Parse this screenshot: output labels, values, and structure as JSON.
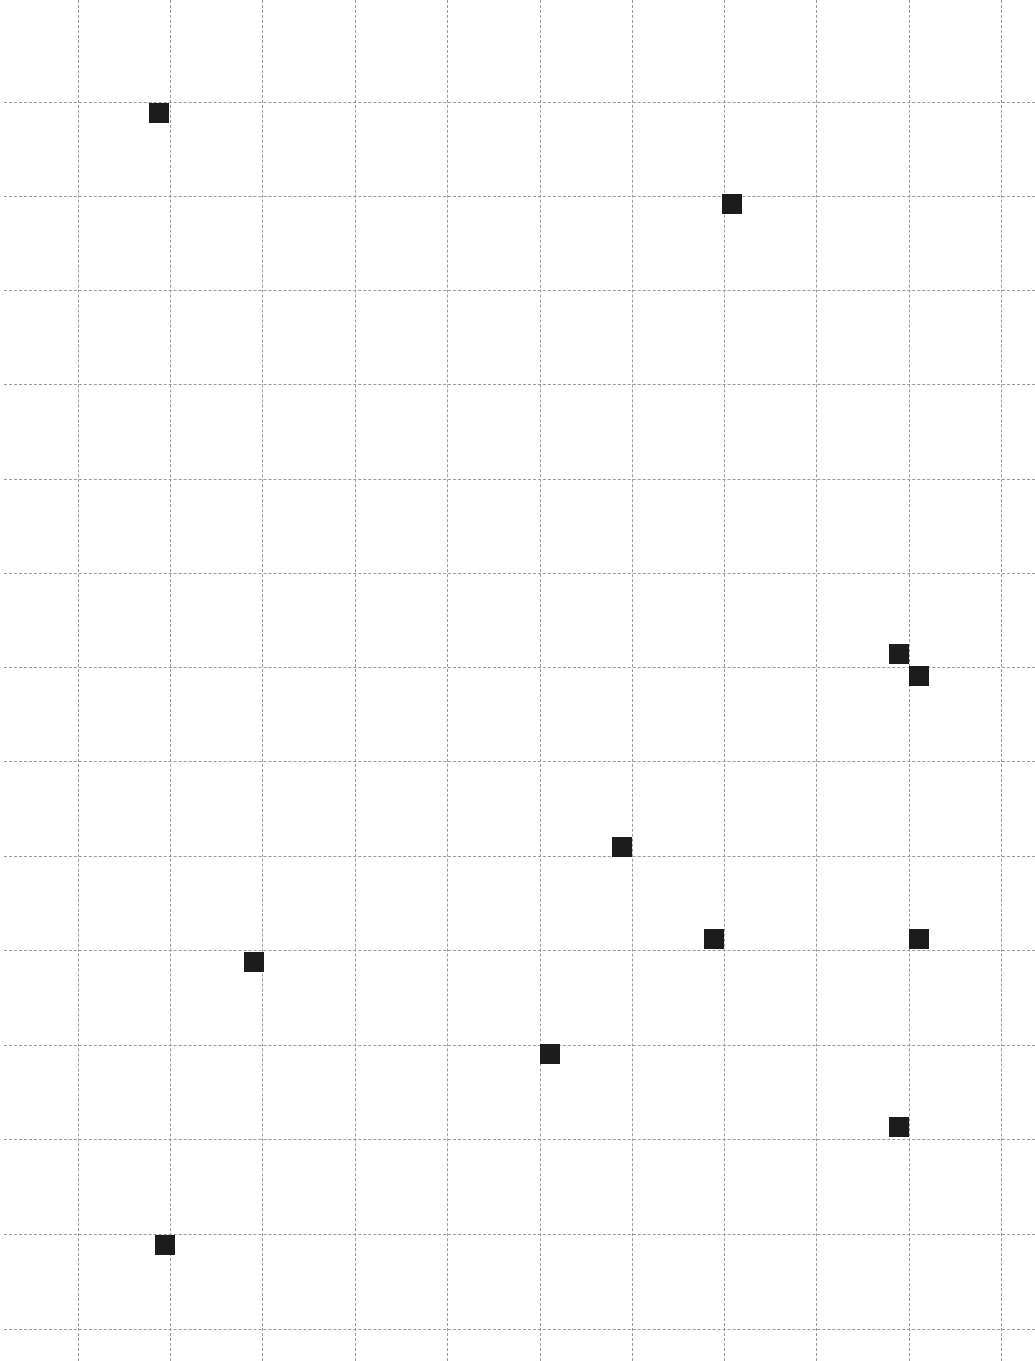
{
  "board": {
    "background": "#ffffff",
    "grid_color": "#9a9a9a",
    "marker_color": "#1c1c1c",
    "marker_size": 20,
    "columns_x": [
      78,
      170,
      262,
      355,
      447,
      540,
      632,
      724,
      816,
      909,
      1001
    ],
    "rows_y": [
      102,
      196,
      290,
      384,
      479,
      573,
      667,
      761,
      856,
      950,
      1045,
      1139,
      1234,
      1329
    ],
    "markers": [
      {
        "x": 159,
        "y": 113
      },
      {
        "x": 732,
        "y": 204
      },
      {
        "x": 899,
        "y": 654
      },
      {
        "x": 919,
        "y": 676
      },
      {
        "x": 622,
        "y": 847
      },
      {
        "x": 714,
        "y": 939
      },
      {
        "x": 919,
        "y": 939
      },
      {
        "x": 254,
        "y": 962
      },
      {
        "x": 550,
        "y": 1054
      },
      {
        "x": 899,
        "y": 1127
      },
      {
        "x": 165,
        "y": 1245
      }
    ]
  }
}
